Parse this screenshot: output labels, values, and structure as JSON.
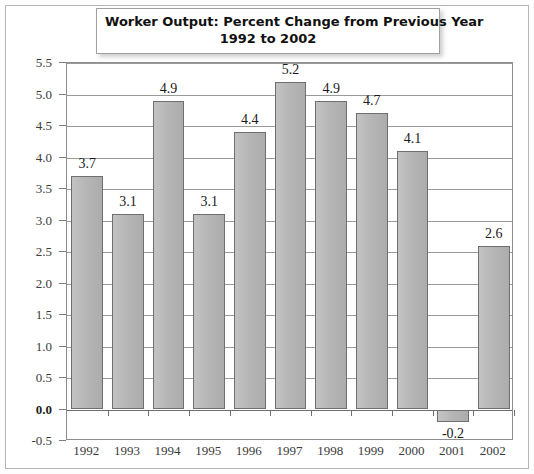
{
  "chart_data": {
    "type": "bar",
    "title": "Worker Output: Percent Change from Previous Year 1992 to 2002",
    "title_lines": [
      "Worker Output: Percent Change from Previous Year",
      "1992 to 2002"
    ],
    "xlabel": "",
    "ylabel": "",
    "categories": [
      "1992",
      "1993",
      "1994",
      "1995",
      "1996",
      "1997",
      "1998",
      "1999",
      "2000",
      "2001",
      "2002"
    ],
    "values": [
      3.7,
      3.1,
      4.9,
      3.1,
      4.4,
      5.2,
      4.9,
      4.7,
      4.1,
      -0.2,
      2.6
    ],
    "value_labels": [
      "3.7",
      "3.1",
      "4.9",
      "3.1",
      "4.4",
      "5.2",
      "4.9",
      "4.7",
      "4.1",
      "-0.2",
      "2.6"
    ],
    "ylim": [
      -0.5,
      5.5
    ],
    "ytick_step": 0.5,
    "ytick_labels": [
      "5.5",
      "5.0",
      "4.5",
      "4.0",
      "3.5",
      "3.0",
      "2.5",
      "2.0",
      "1.5",
      "1.0",
      "0.5",
      "0.0",
      "-0.5"
    ],
    "ytick_values": [
      5.5,
      5.0,
      4.5,
      4.0,
      3.5,
      3.0,
      2.5,
      2.0,
      1.5,
      1.0,
      0.5,
      0.0,
      -0.5
    ],
    "emphasized_ytick": "0.0",
    "grid": true,
    "grid_axis": "y",
    "legend": false,
    "legend_position": "none",
    "bar_fill_color": "#b9b9b9",
    "bar_border_color": "#6f6f6f",
    "gridline_color": "#9a9a9a",
    "zero_line_color": "#6e6e6e",
    "plot_border_color": "#8d8d8d",
    "units": "percent"
  }
}
